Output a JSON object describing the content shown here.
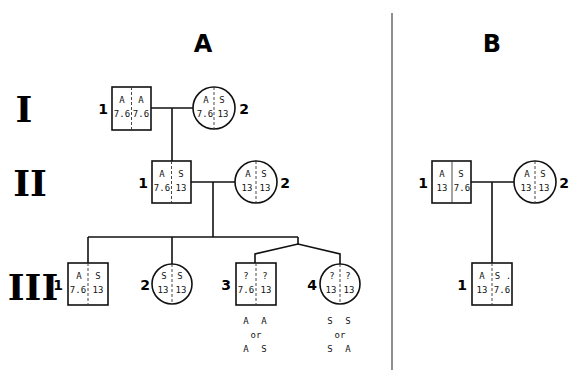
{
  "panels": {
    "A": {
      "title": "A"
    },
    "B": {
      "title": "B"
    }
  },
  "generations": [
    "I",
    "II",
    "III"
  ],
  "pedigree_A": {
    "I": [
      {
        "id": "1",
        "sex": "male",
        "top": [
          "A",
          "A"
        ],
        "bottom": [
          "7.6",
          "7.6"
        ]
      },
      {
        "id": "2",
        "sex": "female",
        "top": [
          "A",
          "S"
        ],
        "bottom": [
          "7.6",
          "13"
        ]
      }
    ],
    "II": [
      {
        "id": "1",
        "sex": "male",
        "top": [
          "A",
          "S"
        ],
        "bottom": [
          "7.6",
          "13"
        ]
      },
      {
        "id": "2",
        "sex": "female",
        "top": [
          "A",
          "S"
        ],
        "bottom": [
          "13",
          "13"
        ]
      }
    ],
    "III": [
      {
        "id": "1",
        "sex": "male",
        "top": [
          "A",
          "S"
        ],
        "bottom": [
          "7.6",
          "13"
        ]
      },
      {
        "id": "2",
        "sex": "female",
        "top": [
          "S",
          "S"
        ],
        "bottom": [
          "13",
          "13"
        ]
      },
      {
        "id": "3",
        "sex": "male",
        "top": [
          "?",
          "?"
        ],
        "bottom": [
          "7.6",
          "13"
        ],
        "alternatives": {
          "first": [
            "A",
            "A"
          ],
          "connector": "or",
          "second": [
            "A",
            "S"
          ]
        }
      },
      {
        "id": "4",
        "sex": "female",
        "top": [
          "?",
          "?"
        ],
        "bottom": [
          "13",
          "13"
        ],
        "alternatives": {
          "first": [
            "S",
            "S"
          ],
          "connector": "or",
          "second": [
            "S",
            "A"
          ]
        }
      }
    ]
  },
  "pedigree_B": {
    "II": [
      {
        "id": "1",
        "sex": "male",
        "top": [
          "A",
          "S"
        ],
        "bottom": [
          "13",
          "7.6"
        ]
      },
      {
        "id": "2",
        "sex": "female",
        "top": [
          "A",
          "S"
        ],
        "bottom": [
          "13",
          "13"
        ]
      }
    ],
    "III": [
      {
        "id": "1",
        "sex": "male",
        "top": [
          "A",
          "S ."
        ],
        "bottom": [
          "13",
          "7.6"
        ]
      }
    ]
  }
}
